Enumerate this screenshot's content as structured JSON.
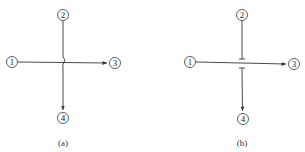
{
  "diagrams": [
    {
      "id": "a",
      "caption": "(a)",
      "crossing_style": "jump-over",
      "nodes": [
        {
          "label": "1",
          "x": 12,
          "y": 62
        },
        {
          "label": "2",
          "x": 63,
          "y": 15
        },
        {
          "label": "3",
          "x": 115,
          "y": 63
        },
        {
          "label": "4",
          "x": 63,
          "y": 118
        }
      ],
      "edges": [
        {
          "from": "1",
          "to": "3",
          "directed": true
        },
        {
          "from": "2",
          "to": "4",
          "directed": true
        }
      ]
    },
    {
      "id": "b",
      "caption": "(b)",
      "crossing_style": "break-gap",
      "nodes": [
        {
          "label": "1",
          "x": 190,
          "y": 62
        },
        {
          "label": "2",
          "x": 242,
          "y": 15
        },
        {
          "label": "3",
          "x": 294,
          "y": 64
        },
        {
          "label": "4",
          "x": 243,
          "y": 119
        }
      ],
      "edges": [
        {
          "from": "1",
          "to": "3",
          "directed": true
        },
        {
          "from": "2",
          "to": "4",
          "directed": true
        }
      ]
    }
  ],
  "colors": {
    "line": "#333333",
    "background": "#ffffff"
  }
}
